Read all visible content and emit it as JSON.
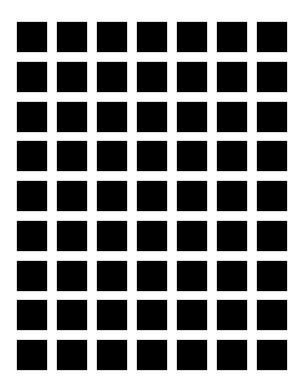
{
  "figure": {
    "type": "square-grid-illusion",
    "rows": 9,
    "columns": 7,
    "square_color": "#000000",
    "background_color": "#ffffff",
    "square_size_px": 30,
    "gap_px": 10
  }
}
